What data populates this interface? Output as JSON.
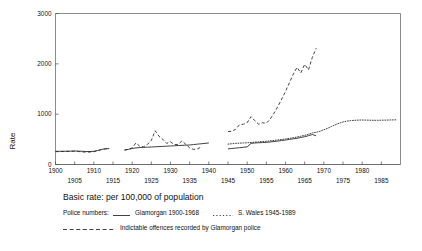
{
  "chart_data": {
    "type": "line",
    "title": "",
    "xlabel": "",
    "ylabel": "Rate",
    "xlim": [
      1900,
      1990
    ],
    "ylim": [
      0,
      3000
    ],
    "grid": false,
    "legend_position": "below-plot",
    "yticks": [
      0,
      1000,
      2000,
      3000
    ],
    "ytick_labels": [
      "0",
      "1000",
      "2000",
      "3000"
    ],
    "xticks_upper": [
      1900,
      1910,
      1920,
      1930,
      1940,
      1950,
      1960,
      1970,
      1980
    ],
    "xticks_lower": [
      1905,
      1915,
      1925,
      1935,
      1945,
      1955,
      1965,
      1975,
      1985
    ],
    "xtick_upper_labels": [
      "1900",
      "1910",
      "1920",
      "1930",
      "1940",
      "1950",
      "1960",
      "1970",
      "1980"
    ],
    "xtick_lower_labels": [
      "1905",
      "1915",
      "1925",
      "1935",
      "1945",
      "1955",
      "1965",
      "1975",
      "1985"
    ],
    "series": [
      {
        "name": "Glamorgan police numbers 1900-1968",
        "style": "solid",
        "segments": [
          {
            "x": [
              1900,
              1901,
              1902,
              1903,
              1904,
              1905,
              1906,
              1907,
              1908,
              1909,
              1910,
              1911,
              1912,
              1913,
              1914
            ],
            "values": [
              262,
              262,
              263,
              264,
              265,
              268,
              266,
              262,
              258,
              258,
              262,
              278,
              300,
              312,
              316
            ]
          },
          {
            "x": [
              1918,
              1919,
              1920,
              1921,
              1922,
              1923,
              1924,
              1925,
              1926,
              1927,
              1928,
              1929,
              1930,
              1931,
              1932,
              1933,
              1934,
              1935,
              1936,
              1937,
              1938,
              1939,
              1940
            ],
            "values": [
              290,
              300,
              318,
              330,
              336,
              340,
              344,
              348,
              352,
              356,
              360,
              364,
              368,
              372,
              376,
              380,
              384,
              388,
              396,
              404,
              412,
              420,
              428
            ]
          },
          {
            "x": [
              1945,
              1946,
              1947,
              1948,
              1949,
              1950,
              1951,
              1952,
              1953,
              1954,
              1955,
              1956,
              1957,
              1958,
              1959,
              1960,
              1961,
              1962,
              1963,
              1964,
              1965,
              1966,
              1967,
              1968
            ],
            "values": [
              310,
              318,
              326,
              334,
              342,
              350,
              420,
              428,
              432,
              436,
              440,
              448,
              456,
              466,
              476,
              486,
              498,
              510,
              522,
              536,
              552,
              572,
              596,
              570
            ]
          }
        ]
      },
      {
        "name": "S. Wales police numbers 1945-1989",
        "style": "dotted",
        "segments": [
          {
            "x": [
              1945,
              1946,
              1947,
              1948,
              1949,
              1950,
              1951,
              1952,
              1953,
              1954,
              1955,
              1956,
              1957,
              1958,
              1959,
              1960,
              1961,
              1962,
              1963,
              1964,
              1965,
              1966,
              1967,
              1968,
              1969,
              1970,
              1971,
              1972,
              1973,
              1974,
              1975,
              1976,
              1977,
              1978,
              1979,
              1980,
              1981,
              1982,
              1983,
              1984,
              1985,
              1986,
              1987,
              1988,
              1989
            ],
            "values": [
              405,
              412,
              420,
              424,
              428,
              432,
              438,
              444,
              450,
              456,
              462,
              470,
              478,
              488,
              498,
              508,
              520,
              532,
              546,
              562,
              580,
              600,
              628,
              640,
              660,
              690,
              720,
              755,
              790,
              820,
              845,
              862,
              872,
              878,
              882,
              884,
              882,
              880,
              878,
              878,
              880,
              882,
              884,
              886,
              888
            ]
          }
        ]
      },
      {
        "name": "Indictable offences recorded by Glamorgan police",
        "style": "dashed",
        "segments": [
          {
            "x": [
              1900,
              1901,
              1902,
              1903,
              1904,
              1905,
              1906,
              1907,
              1908,
              1909,
              1910,
              1911,
              1912,
              1913,
              1914
            ],
            "values": [
              255,
              256,
              258,
              260,
              262,
              264,
              258,
              250,
              246,
              248,
              256,
              272,
              296,
              310,
              318
            ]
          },
          {
            "x": [
              1918,
              1919,
              1920,
              1921,
              1922,
              1923,
              1924,
              1925,
              1926,
              1927,
              1928,
              1929,
              1930,
              1931,
              1932,
              1933,
              1934,
              1935,
              1936,
              1937,
              1938
            ],
            "values": [
              285,
              300,
              330,
              430,
              360,
              352,
              400,
              480,
              670,
              560,
              500,
              420,
              450,
              395,
              400,
              470,
              400,
              330,
              300,
              310,
              345
            ]
          },
          {
            "x": [
              1945,
              1946,
              1947,
              1948,
              1949,
              1950,
              1951,
              1952,
              1953,
              1954,
              1955,
              1956,
              1957,
              1958,
              1959,
              1960,
              1961,
              1962,
              1963,
              1964,
              1965,
              1966,
              1967,
              1968
            ],
            "values": [
              655,
              660,
              700,
              790,
              800,
              830,
              950,
              870,
              800,
              830,
              820,
              900,
              1020,
              1150,
              1300,
              1450,
              1620,
              1790,
              1930,
              1820,
              1990,
              1880,
              2130,
              2310
            ]
          }
        ]
      }
    ]
  },
  "caption": {
    "basic_rate": "Basic rate: per 100,000 of population",
    "legend_prefix": "Police numbers:",
    "legend_item_1": "Glamorgan 1900-1968",
    "legend_item_2": "S. Wales 1945-1989",
    "legend_item_3": "Indictable offences  recorded by Glamorgan police"
  }
}
